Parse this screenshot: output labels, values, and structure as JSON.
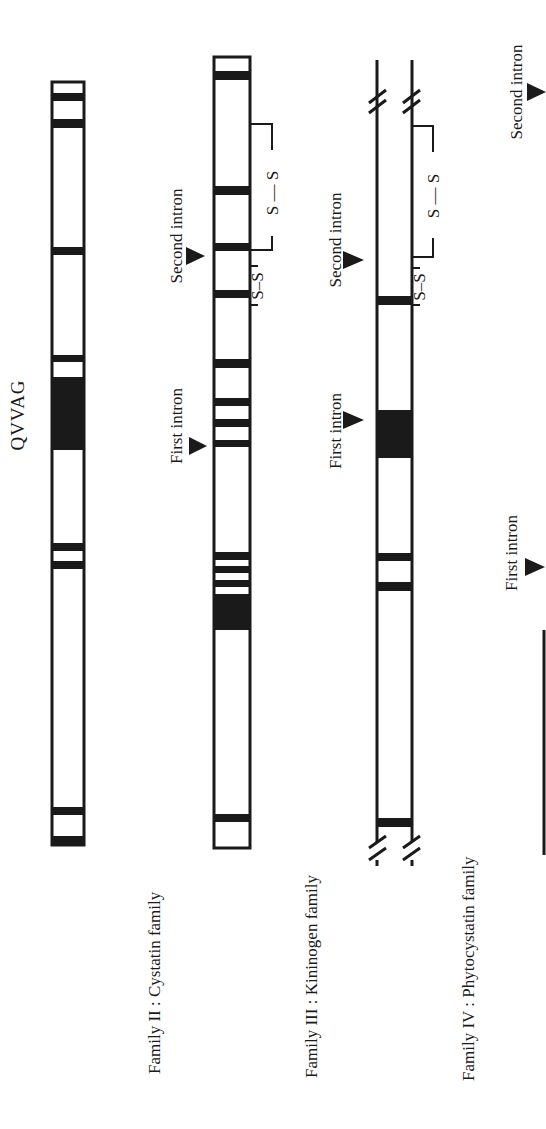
{
  "diagram": {
    "orientation": "rotated 90 degrees counter-clockwise",
    "motif_label": "QVVAG",
    "families": [
      {
        "id": "family-1",
        "label": "",
        "bar": {
          "x": 52,
          "w": 32,
          "y_top": 82,
          "y_bottom": 845,
          "style": "closed"
        },
        "bands": [
          [
            82,
            87
          ],
          [
            93,
            101
          ],
          [
            119,
            128
          ],
          [
            247,
            255
          ],
          [
            355,
            362
          ],
          [
            377,
            450
          ],
          [
            543,
            551
          ],
          [
            561,
            569
          ],
          [
            807,
            815
          ],
          [
            836,
            845
          ]
        ],
        "introns": []
      },
      {
        "id": "family-2",
        "label": "Family II : Cystatin family",
        "bar": {
          "x": 212,
          "w": 38,
          "y_top": 57,
          "y_bottom": 848,
          "style": "closed"
        },
        "bands": [
          [
            71,
            80
          ],
          [
            186,
            195
          ],
          [
            243,
            251
          ],
          [
            290,
            298
          ],
          [
            359,
            368
          ],
          [
            398,
            406
          ],
          [
            419,
            427
          ],
          [
            440,
            447
          ],
          [
            552,
            560
          ],
          [
            566,
            573
          ],
          [
            580,
            587
          ],
          [
            594,
            630
          ],
          [
            814,
            822
          ]
        ],
        "introns": [
          {
            "label": "First intron",
            "y": 446
          },
          {
            "label": "Second intron",
            "y": 256
          }
        ],
        "disulfides": [
          {
            "text": "S — S",
            "y1": 124,
            "y2": 250
          },
          {
            "text": "S–S",
            "y1": 266,
            "y2": 305
          }
        ]
      },
      {
        "id": "family-3",
        "label": "Family III : Kininogen family",
        "bar": {
          "x": 376,
          "w": 36,
          "y_top": 60,
          "y_bottom": 870,
          "style": "broken"
        },
        "bands": [
          [
            296,
            305
          ],
          [
            410,
            458
          ],
          [
            553,
            561
          ],
          [
            582,
            591
          ],
          [
            818,
            827
          ]
        ],
        "introns": [
          {
            "label": "First intron",
            "y": 420
          },
          {
            "label": "Second intron",
            "y": 260
          }
        ],
        "disulfides": [
          {
            "text": "S — S",
            "y1": 126,
            "y2": 257
          },
          {
            "text": "S–S",
            "y1": 266,
            "y2": 306
          }
        ]
      },
      {
        "id": "family-4",
        "label": "Family IV : Phytocystatin family",
        "bar": {
          "x": 543,
          "w": 4,
          "y_top": 630,
          "y_bottom": 855,
          "style": "line"
        },
        "bands": [],
        "introns": [
          {
            "label": "First intron",
            "y": 567
          },
          {
            "label": "Second intron",
            "y": 92
          }
        ]
      }
    ]
  },
  "labels": {
    "qvvag": "QVVAG",
    "family2": "Family II : Cystatin family",
    "family3": "Family III : Kininogen family",
    "family4": "Family IV : Phytocystatin family",
    "first_intron": "First intron",
    "second_intron": "Second intron",
    "ss_long": "S — S",
    "ss_short": "S–S"
  },
  "colors": {
    "ink": "#1a1a1a",
    "background": "#ffffff"
  }
}
